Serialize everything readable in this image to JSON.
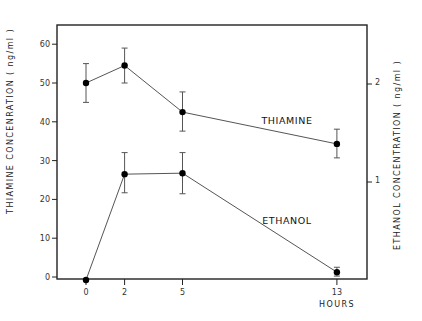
{
  "chart_data": {
    "type": "line",
    "title": "",
    "xlabel": "HOURS",
    "ylabel_left": "THIAMINE CONCENRATION ( ng/ml )",
    "ylabel_right": "ETHANOL CONCENTRATION ( ng/ml )",
    "x": [
      0,
      2,
      5,
      13
    ],
    "x_tick_labels": [
      "0",
      "2",
      "5",
      "13"
    ],
    "y_left_ticks": [
      0,
      10,
      20,
      30,
      40,
      50,
      60
    ],
    "y_right_ticks": [
      1,
      2
    ],
    "ylim_left": [
      0,
      65
    ],
    "ylim_right": [
      0,
      2.6
    ],
    "grid": false,
    "legend": "inline labels",
    "series": [
      {
        "name": "THIAMINE",
        "axis": "left",
        "values": [
          50,
          54.5,
          42.5,
          34.3
        ],
        "err_low": [
          45,
          50,
          37.6,
          30.7
        ],
        "err_high": [
          55,
          59,
          47.7,
          38.1
        ]
      },
      {
        "name": "ETHANOL",
        "axis": "right",
        "values": [
          0,
          1.08,
          1.09,
          0.08
        ],
        "err_low": [
          0,
          0.89,
          0.88,
          0.04
        ],
        "err_high": [
          0,
          1.3,
          1.3,
          0.13
        ]
      }
    ]
  }
}
